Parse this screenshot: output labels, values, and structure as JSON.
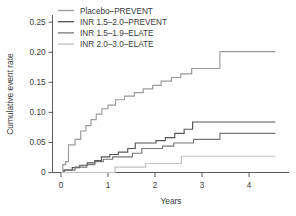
{
  "chart_data": {
    "type": "line",
    "subtype": "step-kaplan-meier",
    "title": "",
    "xlabel": "Years",
    "ylabel": "Cumulative event rate",
    "xlim": [
      -0.18,
      4.85
    ],
    "ylim": [
      0,
      0.262
    ],
    "xticks": [
      0,
      1,
      2,
      3,
      4
    ],
    "xticklabels": [
      "0",
      "1",
      "2",
      "3",
      "4"
    ],
    "yticks": [
      0,
      0.05,
      0.1,
      0.15,
      0.2,
      0.25
    ],
    "yticklabels": [
      "0",
      "0.05",
      "0.10",
      "0.15",
      "0.20",
      "0.25"
    ],
    "grid": false,
    "legend_position": "top-left",
    "series": [
      {
        "name": "Placebo–PREVENT",
        "color": "#9a9a9a",
        "final_value": 0.201,
        "points": [
          [
            0.0,
            0.0
          ],
          [
            0.04,
            0.0
          ],
          [
            0.04,
            0.013
          ],
          [
            0.1,
            0.013
          ],
          [
            0.1,
            0.018
          ],
          [
            0.16,
            0.018
          ],
          [
            0.16,
            0.046
          ],
          [
            0.3,
            0.046
          ],
          [
            0.3,
            0.055
          ],
          [
            0.42,
            0.055
          ],
          [
            0.42,
            0.069
          ],
          [
            0.53,
            0.069
          ],
          [
            0.53,
            0.078
          ],
          [
            0.64,
            0.078
          ],
          [
            0.64,
            0.088
          ],
          [
            0.75,
            0.088
          ],
          [
            0.75,
            0.097
          ],
          [
            0.87,
            0.097
          ],
          [
            0.87,
            0.106
          ],
          [
            1.0,
            0.106
          ],
          [
            1.0,
            0.112
          ],
          [
            1.16,
            0.112
          ],
          [
            1.16,
            0.121
          ],
          [
            1.35,
            0.121
          ],
          [
            1.35,
            0.127
          ],
          [
            1.56,
            0.127
          ],
          [
            1.56,
            0.133
          ],
          [
            1.75,
            0.133
          ],
          [
            1.75,
            0.139
          ],
          [
            1.95,
            0.139
          ],
          [
            1.95,
            0.145
          ],
          [
            2.13,
            0.145
          ],
          [
            2.13,
            0.152
          ],
          [
            2.35,
            0.152
          ],
          [
            2.35,
            0.158
          ],
          [
            2.55,
            0.158
          ],
          [
            2.55,
            0.164
          ],
          [
            2.78,
            0.164
          ],
          [
            2.78,
            0.173
          ],
          [
            3.38,
            0.173
          ],
          [
            3.38,
            0.201
          ],
          [
            4.56,
            0.201
          ]
        ]
      },
      {
        "name": "INR 1.5–2.0–PREVENT",
        "color": "#555555",
        "final_value": 0.084,
        "points": [
          [
            0.0,
            0.0
          ],
          [
            0.07,
            0.0
          ],
          [
            0.07,
            0.004
          ],
          [
            0.24,
            0.004
          ],
          [
            0.24,
            0.008
          ],
          [
            0.4,
            0.008
          ],
          [
            0.4,
            0.012
          ],
          [
            0.56,
            0.012
          ],
          [
            0.56,
            0.016
          ],
          [
            0.72,
            0.016
          ],
          [
            0.72,
            0.02
          ],
          [
            0.86,
            0.02
          ],
          [
            0.86,
            0.026
          ],
          [
            1.04,
            0.026
          ],
          [
            1.04,
            0.03
          ],
          [
            1.22,
            0.03
          ],
          [
            1.22,
            0.034
          ],
          [
            1.42,
            0.034
          ],
          [
            1.42,
            0.04
          ],
          [
            1.58,
            0.04
          ],
          [
            1.58,
            0.049
          ],
          [
            2.02,
            0.049
          ],
          [
            2.02,
            0.053
          ],
          [
            2.22,
            0.053
          ],
          [
            2.22,
            0.058
          ],
          [
            2.42,
            0.058
          ],
          [
            2.42,
            0.065
          ],
          [
            2.62,
            0.065
          ],
          [
            2.62,
            0.072
          ],
          [
            2.8,
            0.072
          ],
          [
            2.8,
            0.084
          ],
          [
            4.56,
            0.084
          ]
        ]
      },
      {
        "name": "INR 1.5–1.9–ELATE",
        "color": "#777777",
        "final_value": 0.065,
        "points": [
          [
            0.0,
            0.0
          ],
          [
            0.06,
            0.0
          ],
          [
            0.06,
            0.004
          ],
          [
            0.3,
            0.004
          ],
          [
            0.3,
            0.009
          ],
          [
            0.55,
            0.009
          ],
          [
            0.55,
            0.013
          ],
          [
            0.72,
            0.013
          ],
          [
            0.72,
            0.018
          ],
          [
            0.9,
            0.018
          ],
          [
            0.9,
            0.022
          ],
          [
            1.1,
            0.022
          ],
          [
            1.1,
            0.026
          ],
          [
            1.52,
            0.026
          ],
          [
            1.52,
            0.032
          ],
          [
            1.72,
            0.032
          ],
          [
            1.72,
            0.04
          ],
          [
            2.16,
            0.04
          ],
          [
            2.16,
            0.044
          ],
          [
            2.4,
            0.044
          ],
          [
            2.4,
            0.049
          ],
          [
            2.82,
            0.049
          ],
          [
            2.82,
            0.055
          ],
          [
            3.38,
            0.055
          ],
          [
            3.38,
            0.065
          ],
          [
            4.56,
            0.065
          ]
        ]
      },
      {
        "name": "INR 2.0–3.0–ELATE",
        "color": "#c2c2c2",
        "final_value": 0.027,
        "points": [
          [
            0.0,
            0.0
          ],
          [
            1.15,
            0.0
          ],
          [
            1.15,
            0.009
          ],
          [
            1.8,
            0.009
          ],
          [
            1.8,
            0.015
          ],
          [
            2.56,
            0.015
          ],
          [
            2.56,
            0.027
          ],
          [
            4.56,
            0.027
          ]
        ]
      }
    ]
  },
  "legend": {
    "items": [
      {
        "label": "Placebo–PREVENT"
      },
      {
        "label": "INR 1.5–2.0–PREVENT"
      },
      {
        "label": "INR 1.5–1.9–ELATE"
      },
      {
        "label": "INR 2.0–3.0–ELATE"
      }
    ]
  },
  "axes": {
    "y_title": "Cumulative event rate",
    "x_title": "Years"
  }
}
